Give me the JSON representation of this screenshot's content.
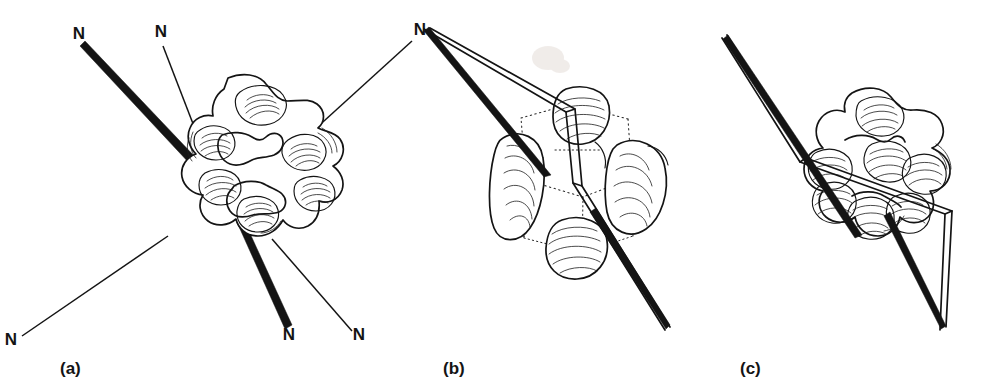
{
  "figure": {
    "background_color": "#ffffff",
    "ink_color": "#141414",
    "width": 1005,
    "height": 390
  },
  "panels": [
    {
      "id": "a",
      "caption": "(a)",
      "caption_x": 60,
      "caption_y": 374,
      "view": "top-down view of the cyclohexane ring showing six nitrogen substituents",
      "atom_labels": [
        {
          "text": "N",
          "x": 79,
          "y": 39,
          "bond": "bold-wedge"
        },
        {
          "text": "N",
          "x": 161,
          "y": 37,
          "bond": "thin-line"
        },
        {
          "text": "N",
          "x": 11,
          "y": 345,
          "bond": "thin-line"
        },
        {
          "text": "N",
          "x": 289,
          "y": 340,
          "bond": "bold-wedge"
        },
        {
          "text": "N",
          "x": 359,
          "y": 340,
          "bond": "thin-line"
        },
        {
          "text": "N",
          "x": 420,
          "y": 35,
          "bond": "thin-line"
        }
      ],
      "nitrogen_count": 6,
      "bold_bond_count": 2,
      "thin_bond_count": 4
    },
    {
      "id": "b",
      "caption": "(b)",
      "caption_x": 443,
      "caption_y": 374,
      "view": "edge-on view with dotted ring skeleton and a double-line coordination plane",
      "atom_labels": [
        {
          "text": "N",
          "x": 420,
          "y": 35,
          "bond": "shared-with-panel-a"
        }
      ],
      "nitrogen_count": 1,
      "has_dotted_skeleton": true,
      "has_double_line_band": true
    },
    {
      "id": "c",
      "caption": "(c)",
      "caption_x": 740,
      "caption_y": 374,
      "view": "tilted view with the double-line coordination plane slicing through the ring",
      "atom_labels": [],
      "nitrogen_count": 0,
      "has_dotted_skeleton": true,
      "has_double_line_band": true
    }
  ],
  "legend": {
    "bold_wedge_meaning": "substituent directed toward the viewer",
    "thin_line_meaning": "substituent directed away from the viewer",
    "dotted_line_meaning": "hidden ring skeleton edges"
  }
}
